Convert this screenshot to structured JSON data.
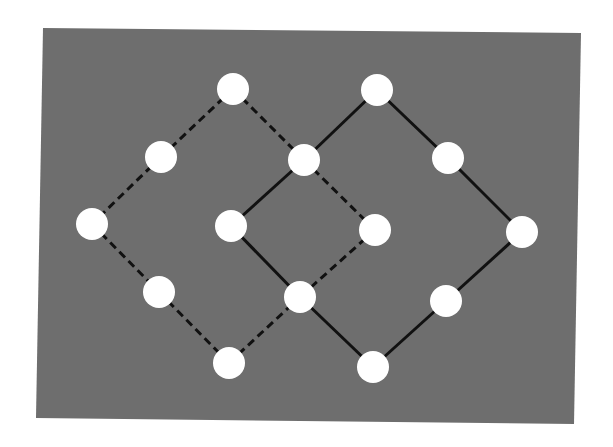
{
  "diagram": {
    "type": "lattice-graph",
    "background_panel": {
      "color": "#6e6e6e",
      "corners": [
        [
          43,
          28
        ],
        [
          581,
          33
        ],
        [
          574,
          424
        ],
        [
          36,
          418
        ]
      ]
    },
    "node_style": {
      "fill": "#ffffff",
      "rx": 16,
      "ry": 16
    },
    "edge_style": {
      "color": "#111111",
      "width": 3,
      "dash": "8,5"
    },
    "nodes": [
      {
        "id": "A",
        "x": 233,
        "y": 89
      },
      {
        "id": "B",
        "x": 377,
        "y": 90
      },
      {
        "id": "C",
        "x": 161,
        "y": 157
      },
      {
        "id": "D",
        "x": 304,
        "y": 160
      },
      {
        "id": "E",
        "x": 448,
        "y": 158
      },
      {
        "id": "F",
        "x": 92,
        "y": 224
      },
      {
        "id": "G",
        "x": 231,
        "y": 226
      },
      {
        "id": "H",
        "x": 375,
        "y": 230
      },
      {
        "id": "I",
        "x": 522,
        "y": 232
      },
      {
        "id": "J",
        "x": 159,
        "y": 292
      },
      {
        "id": "K",
        "x": 300,
        "y": 297
      },
      {
        "id": "L",
        "x": 446,
        "y": 301
      },
      {
        "id": "M",
        "x": 229,
        "y": 363
      },
      {
        "id": "N",
        "x": 373,
        "y": 367
      }
    ],
    "edges": [
      {
        "from": "A",
        "to": "C",
        "style": "dashed"
      },
      {
        "from": "C",
        "to": "F",
        "style": "dashed"
      },
      {
        "from": "F",
        "to": "J",
        "style": "dashed"
      },
      {
        "from": "J",
        "to": "M",
        "style": "dashed"
      },
      {
        "from": "M",
        "to": "K",
        "style": "dashed"
      },
      {
        "from": "A",
        "to": "D",
        "style": "dashed"
      },
      {
        "from": "D",
        "to": "H",
        "style": "dashed"
      },
      {
        "from": "H",
        "to": "K",
        "style": "dashed"
      },
      {
        "from": "B",
        "to": "D",
        "style": "solid"
      },
      {
        "from": "D",
        "to": "G",
        "style": "solid"
      },
      {
        "from": "G",
        "to": "K",
        "style": "solid"
      },
      {
        "from": "K",
        "to": "N",
        "style": "solid"
      },
      {
        "from": "B",
        "to": "E",
        "style": "solid"
      },
      {
        "from": "E",
        "to": "I",
        "style": "solid"
      },
      {
        "from": "I",
        "to": "L",
        "style": "solid"
      },
      {
        "from": "L",
        "to": "N",
        "style": "solid"
      }
    ]
  }
}
